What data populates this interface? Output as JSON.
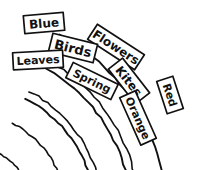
{
  "figure": {
    "background_color": "#ffffff",
    "ink_color": "#111111",
    "width": 198,
    "height": 170
  },
  "chart_data": {
    "type": "diagram",
    "subtype": "concentric-arc-label-sketch",
    "style": "hand-drawn ink sketch, black on white",
    "arc_center": {
      "x": -36,
      "y": 214
    },
    "bands": [
      {
        "name": "outer-band",
        "index": 1,
        "inner_radius": 175,
        "outer_radius": 203,
        "labels": [
          "Blue",
          "Flowers",
          "Red"
        ]
      },
      {
        "name": "middle-band",
        "index": 2,
        "inner_radius": 139,
        "outer_radius": 167,
        "labels": [
          "Birds",
          "Kites"
        ]
      },
      {
        "name": "inner-band",
        "index": 3,
        "inner_radius": 103,
        "outer_radius": 131,
        "labels": [
          "Leaves",
          "Spring",
          "Orange"
        ]
      },
      {
        "name": "innermost-arc",
        "index": 4,
        "inner_radius": 70,
        "outer_radius": 70,
        "labels": []
      }
    ],
    "labels": [
      {
        "text": "Blue",
        "band": "outer-band",
        "x": 44,
        "y": 23,
        "rotation": -5,
        "box_w": 40,
        "box_h": 18,
        "font_size": 12
      },
      {
        "text": "Flowers",
        "band": "outer-band",
        "x": 116,
        "y": 47,
        "rotation": 33,
        "box_w": 56,
        "box_h": 18,
        "font_size": 12
      },
      {
        "text": "Red",
        "band": "outer-band",
        "x": 170,
        "y": 95,
        "rotation": 72,
        "box_w": 34,
        "box_h": 17,
        "font_size": 11
      },
      {
        "text": "Birds",
        "band": "middle-band",
        "x": 73,
        "y": 48,
        "rotation": 14,
        "box_w": 46,
        "box_h": 19,
        "font_size": 13
      },
      {
        "text": "Kites",
        "band": "middle-band",
        "x": 129,
        "y": 81,
        "rotation": 52,
        "box_w": 44,
        "box_h": 18,
        "font_size": 12
      },
      {
        "text": "Leaves",
        "band": "inner-band",
        "x": 38,
        "y": 60,
        "rotation": -3,
        "box_w": 50,
        "box_h": 17,
        "font_size": 11
      },
      {
        "text": "Spring",
        "band": "inner-band",
        "x": 92,
        "y": 81,
        "rotation": 26,
        "box_w": 50,
        "box_h": 17,
        "font_size": 11
      },
      {
        "text": "Orange",
        "band": "inner-band",
        "x": 138,
        "y": 118,
        "rotation": 66,
        "box_w": 52,
        "box_h": 17,
        "font_size": 11
      }
    ]
  }
}
